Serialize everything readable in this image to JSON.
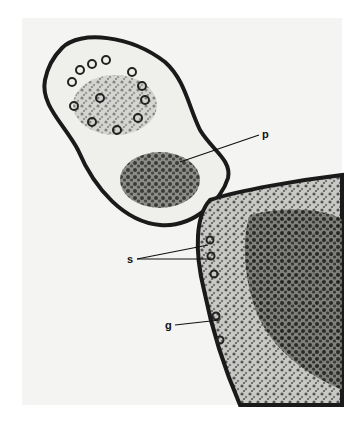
{
  "figure": {
    "labels": [
      {
        "id": "p",
        "text": "p",
        "x": 262,
        "y": 129
      },
      {
        "id": "s",
        "text": "s",
        "x": 127,
        "y": 255
      },
      {
        "id": "g",
        "text": "g",
        "x": 165,
        "y": 321
      }
    ]
  }
}
